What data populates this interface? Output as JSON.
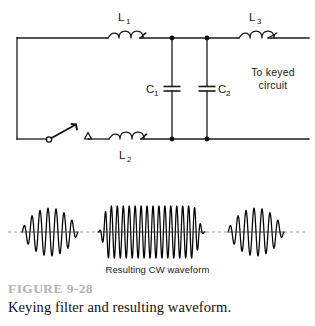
{
  "figure": {
    "number_label": "FIGURE 9-28",
    "caption": "Keying filter and resulting waveform."
  },
  "circuit": {
    "type": "keying-filter-schematic",
    "components": [
      {
        "id": "L1",
        "kind": "inductor",
        "label": "L",
        "subscript": "1",
        "rail": "top"
      },
      {
        "id": "L2",
        "kind": "inductor",
        "label": "L",
        "subscript": "2",
        "rail": "bottom"
      },
      {
        "id": "L3",
        "kind": "inductor",
        "label": "L",
        "subscript": "3",
        "rail": "top"
      },
      {
        "id": "C1",
        "kind": "capacitor",
        "label": "C",
        "subscript": "1",
        "label_side": "left"
      },
      {
        "id": "C2",
        "kind": "capacitor",
        "label": "C",
        "subscript": "2",
        "label_side": "right"
      },
      {
        "id": "SW",
        "kind": "key-switch",
        "label": "",
        "subscript": ""
      }
    ],
    "output_label_line1": "To keyed",
    "output_label_line2": "circuit"
  },
  "waveform": {
    "label": "Resulting CW waveform",
    "bursts": [
      {
        "name": "dit-1",
        "cycles": 7,
        "shape": "raised-cosine-envelope"
      },
      {
        "name": "dah",
        "cycles": 18,
        "shape": "flat-top-envelope"
      },
      {
        "name": "dit-2",
        "cycles": 7,
        "shape": "raised-cosine-envelope"
      }
    ]
  },
  "colors": {
    "ink": "#1a1a1a",
    "wave": "#000000",
    "figure_number": "#b3b3b3",
    "baseline": "#3a3a3a"
  }
}
